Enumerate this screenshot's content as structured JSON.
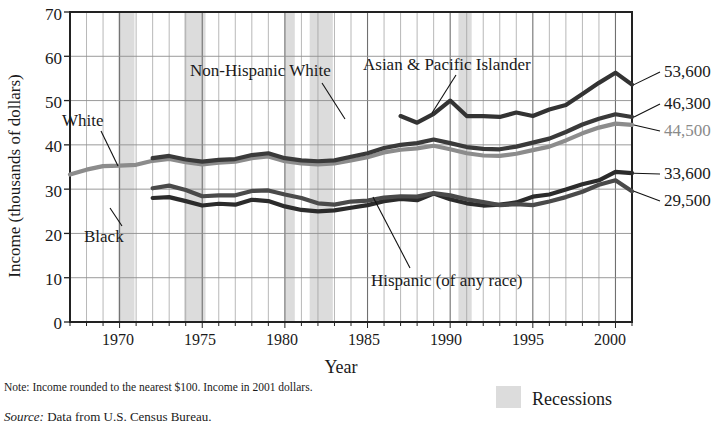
{
  "chart_data": {
    "type": "line",
    "title": "",
    "xlabel": "Year",
    "ylabel": "Income (thousands of dollars)",
    "xlim": [
      1967,
      2001
    ],
    "ylim": [
      0,
      70
    ],
    "yticks": [
      0,
      10,
      20,
      30,
      40,
      50,
      60,
      70
    ],
    "xticks": [
      1970,
      1975,
      1980,
      1985,
      1990,
      1995,
      2000
    ],
    "grid": "major horizontal and yearly vertical gridlines",
    "legend_position": "below-right (Recessions swatch)",
    "annotations": {
      "note": "Note: Income rounded to the nearest $100. Income in 2001 dollars.",
      "source_label": "Source:",
      "source_text": "Data from U.S. Census Bureau.",
      "recessions_label": "Recessions"
    },
    "recessions": [
      {
        "start": 1969.9,
        "end": 1970.9
      },
      {
        "start": 1973.9,
        "end": 1975.2
      },
      {
        "start": 1980.0,
        "end": 1980.6
      },
      {
        "start": 1981.5,
        "end": 1982.9
      },
      {
        "start": 1990.5,
        "end": 1991.3
      }
    ],
    "series": [
      {
        "name": "White",
        "color": "#8c8c8c",
        "end_value_label": "44,500",
        "x": [
          1967,
          1968,
          1969,
          1970,
          1971,
          1972,
          1973,
          1974,
          1975,
          1976,
          1977,
          1978,
          1979,
          1980,
          1981,
          1982,
          1983,
          1984,
          1985,
          1986,
          1987,
          1988,
          1989,
          1990,
          1991,
          1992,
          1993,
          1994,
          1995,
          1996,
          1997,
          1998,
          1999,
          2000,
          2001
        ],
        "values": [
          33.3,
          34.4,
          35.2,
          35.3,
          35.5,
          36.4,
          36.8,
          36.1,
          35.6,
          36.0,
          36.2,
          37.0,
          37.4,
          36.3,
          35.8,
          35.6,
          35.8,
          36.5,
          37.2,
          38.3,
          38.9,
          39.2,
          39.8,
          39.0,
          38.1,
          37.6,
          37.5,
          38.0,
          38.8,
          39.6,
          41.0,
          42.6,
          43.9,
          44.8,
          44.5
        ]
      },
      {
        "name": "Non-Hispanic White",
        "color": "#3a3a3a",
        "end_value_label": "46,300",
        "x": [
          1972,
          1973,
          1974,
          1975,
          1976,
          1977,
          1978,
          1979,
          1980,
          1981,
          1982,
          1983,
          1984,
          1985,
          1986,
          1987,
          1988,
          1989,
          1990,
          1991,
          1992,
          1993,
          1994,
          1995,
          1996,
          1997,
          1998,
          1999,
          2000,
          2001
        ],
        "values": [
          37.0,
          37.5,
          36.7,
          36.2,
          36.6,
          36.8,
          37.7,
          38.1,
          37.0,
          36.5,
          36.3,
          36.5,
          37.3,
          38.1,
          39.3,
          40.0,
          40.4,
          41.2,
          40.4,
          39.5,
          39.1,
          39.0,
          39.6,
          40.5,
          41.4,
          42.9,
          44.6,
          45.9,
          46.9,
          46.3
        ]
      },
      {
        "name": "Asian & Pacific Islander",
        "color": "#333333",
        "end_value_label": "53,600",
        "x": [
          1987,
          1988,
          1989,
          1990,
          1991,
          1992,
          1993,
          1994,
          1995,
          1996,
          1997,
          1998,
          1999,
          2000,
          2001
        ],
        "values": [
          46.5,
          45.0,
          47.0,
          50.0,
          46.5,
          46.5,
          46.3,
          47.3,
          46.5,
          48.0,
          49.0,
          51.5,
          54.0,
          56.3,
          53.6
        ]
      },
      {
        "name": "Black",
        "color": "#2b2b2b",
        "end_value_label": "33,600",
        "x": [
          1972,
          1973,
          1974,
          1975,
          1976,
          1977,
          1978,
          1979,
          1980,
          1981,
          1982,
          1983,
          1984,
          1985,
          1986,
          1987,
          1988,
          1989,
          1990,
          1991,
          1992,
          1993,
          1994,
          1995,
          1996,
          1997,
          1998,
          1999,
          2000,
          2001
        ],
        "values": [
          28.0,
          28.2,
          27.3,
          26.3,
          26.7,
          26.5,
          27.6,
          27.3,
          26.1,
          25.3,
          25.0,
          25.2,
          25.8,
          26.4,
          27.3,
          27.8,
          27.5,
          29.0,
          27.7,
          26.8,
          26.3,
          26.5,
          27.0,
          28.3,
          28.8,
          29.9,
          31.1,
          32.0,
          33.9,
          33.6
        ]
      },
      {
        "name": "Hispanic (of any race)",
        "color": "#4a4a4a",
        "end_value_label": "29,500",
        "x": [
          1972,
          1973,
          1974,
          1975,
          1976,
          1977,
          1978,
          1979,
          1980,
          1981,
          1982,
          1983,
          1984,
          1985,
          1986,
          1987,
          1988,
          1989,
          1990,
          1991,
          1992,
          1993,
          1994,
          1995,
          1996,
          1997,
          1998,
          1999,
          2000,
          2001
        ],
        "values": [
          30.2,
          30.8,
          29.8,
          28.4,
          28.6,
          28.6,
          29.6,
          29.7,
          28.8,
          28.0,
          26.8,
          26.5,
          27.2,
          27.4,
          28.1,
          28.4,
          28.3,
          29.1,
          28.6,
          27.7,
          27.1,
          26.4,
          26.6,
          26.4,
          27.2,
          28.2,
          29.4,
          31.0,
          32.0,
          29.5
        ]
      }
    ],
    "yaxis_tick_labels": [
      "0",
      "10",
      "20",
      "30",
      "40",
      "50",
      "60",
      "70"
    ],
    "xaxis_tick_labels": [
      "1970",
      "1975",
      "1980",
      "1985",
      "1990",
      "1995",
      "2000"
    ],
    "end_labels": [
      "53,600",
      "46,300",
      "44,500",
      "33,600",
      "29,500"
    ],
    "series_label_texts": [
      "White",
      "Black",
      "Non-Hispanic White",
      "Asian & Pacific Islander",
      "Hispanic (of any race)"
    ]
  }
}
